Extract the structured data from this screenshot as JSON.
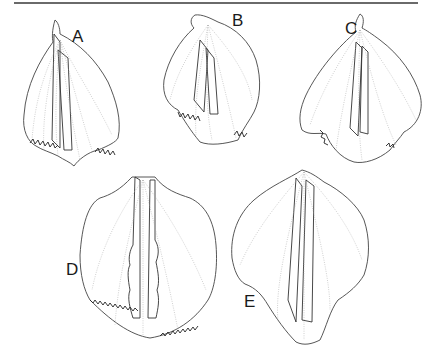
{
  "figure": {
    "type": "botanical line illustration",
    "panels": [
      {
        "id": "A",
        "label": "A",
        "label_pos": [
          72,
          35
        ],
        "margin": "fringed lower margin"
      },
      {
        "id": "B",
        "label": "B",
        "label_pos": [
          232,
          20
        ],
        "margin": "fringed lower margin"
      },
      {
        "id": "C",
        "label": "C",
        "label_pos": [
          345,
          28
        ],
        "margin": "erose lower margin"
      },
      {
        "id": "D",
        "label": "D",
        "label_pos": [
          68,
          268
        ],
        "margin": "densely fringed lower margin, undulate keels"
      },
      {
        "id": "E",
        "label": "E",
        "label_pos": [
          246,
          300
        ],
        "margin": "entire, acuminate apex"
      }
    ]
  },
  "colors": {
    "background": "#ffffff",
    "outline": "#444444",
    "vein": "#a9a9a9",
    "rule": "#6a6a6a"
  }
}
